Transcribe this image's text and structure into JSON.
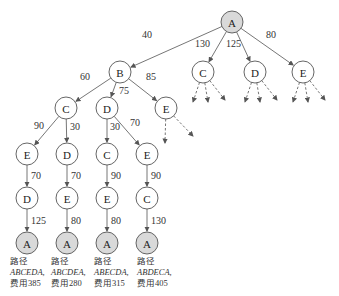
{
  "diagram": {
    "type": "search-tree",
    "colors": {
      "terminal_fill": "#d9d9d9",
      "node_fill": "#ffffff",
      "stroke": "#555555"
    },
    "nodes": [
      {
        "id": "root",
        "label": "A",
        "x": 232,
        "y": 22,
        "shaded": true
      },
      {
        "id": "B1",
        "label": "B",
        "x": 120,
        "y": 72
      },
      {
        "id": "C1",
        "label": "C",
        "x": 203,
        "y": 72
      },
      {
        "id": "D1",
        "label": "D",
        "x": 255,
        "y": 72
      },
      {
        "id": "E1",
        "label": "E",
        "x": 303,
        "y": 72
      },
      {
        "id": "C2",
        "label": "C",
        "x": 66,
        "y": 108
      },
      {
        "id": "D2",
        "label": "D",
        "x": 107,
        "y": 108
      },
      {
        "id": "E2",
        "label": "E",
        "x": 166,
        "y": 108
      },
      {
        "id": "E3a",
        "label": "E",
        "x": 27,
        "y": 154
      },
      {
        "id": "D3a",
        "label": "D",
        "x": 67,
        "y": 154
      },
      {
        "id": "C3b",
        "label": "C",
        "x": 107,
        "y": 154
      },
      {
        "id": "E3b",
        "label": "E",
        "x": 147,
        "y": 154
      },
      {
        "id": "D4a",
        "label": "D",
        "x": 27,
        "y": 198
      },
      {
        "id": "E4a",
        "label": "E",
        "x": 67,
        "y": 198
      },
      {
        "id": "E4b",
        "label": "E",
        "x": 107,
        "y": 198
      },
      {
        "id": "C4b",
        "label": "C",
        "x": 147,
        "y": 198
      },
      {
        "id": "A5a",
        "label": "A",
        "x": 27,
        "y": 243,
        "shaded": true
      },
      {
        "id": "A5b",
        "label": "A",
        "x": 67,
        "y": 243,
        "shaded": true
      },
      {
        "id": "A5c",
        "label": "A",
        "x": 107,
        "y": 243,
        "shaded": true
      },
      {
        "id": "A5d",
        "label": "A",
        "x": 147,
        "y": 243,
        "shaded": true
      }
    ],
    "edges": [
      {
        "from": "root",
        "to": "B1",
        "weight": "40",
        "lx": 142,
        "ly": 38
      },
      {
        "from": "root",
        "to": "C1",
        "weight": "130",
        "lx": 195,
        "ly": 47
      },
      {
        "from": "root",
        "to": "D1",
        "weight": "125",
        "lx": 226,
        "ly": 47
      },
      {
        "from": "root",
        "to": "E1",
        "weight": "80",
        "lx": 266,
        "ly": 38
      },
      {
        "from": "B1",
        "to": "C2",
        "weight": "60",
        "lx": 80,
        "ly": 80
      },
      {
        "from": "B1",
        "to": "D2",
        "weight": "75",
        "lx": 119,
        "ly": 94
      },
      {
        "from": "B1",
        "to": "E2",
        "weight": "85",
        "lx": 146,
        "ly": 80
      },
      {
        "from": "C2",
        "to": "E3a",
        "weight": "90",
        "lx": 34,
        "ly": 129
      },
      {
        "from": "C2",
        "to": "D3a",
        "weight": "30",
        "lx": 70,
        "ly": 130
      },
      {
        "from": "D2",
        "to": "C3b",
        "weight": "30",
        "lx": 110,
        "ly": 130
      },
      {
        "from": "D2",
        "to": "E3b",
        "weight": "70",
        "lx": 130,
        "ly": 126
      },
      {
        "from": "E3a",
        "to": "D4a",
        "weight": "70",
        "lx": 31,
        "ly": 179
      },
      {
        "from": "D3a",
        "to": "E4a",
        "weight": "70",
        "lx": 71,
        "ly": 179
      },
      {
        "from": "C3b",
        "to": "E4b",
        "weight": "90",
        "lx": 111,
        "ly": 179
      },
      {
        "from": "E3b",
        "to": "C4b",
        "weight": "90",
        "lx": 151,
        "ly": 179
      },
      {
        "from": "D4a",
        "to": "A5a",
        "weight": "125",
        "lx": 31,
        "ly": 224
      },
      {
        "from": "E4a",
        "to": "A5b",
        "weight": "80",
        "lx": 71,
        "ly": 224
      },
      {
        "from": "E4b",
        "to": "A5c",
        "weight": "80",
        "lx": 111,
        "ly": 224
      },
      {
        "from": "C4b",
        "to": "A5d",
        "weight": "130",
        "lx": 151,
        "ly": 224
      }
    ],
    "results": [
      {
        "label": "路径",
        "path": "ABCEDA,",
        "cost": "费用385",
        "x": 10,
        "y": 256
      },
      {
        "label": "路径",
        "path": "ABCDEA,",
        "cost": "费用280",
        "x": 51,
        "y": 256
      },
      {
        "label": "路径",
        "path": "ABECDA,",
        "cost": "费用315",
        "x": 94,
        "y": 256
      },
      {
        "label": "路径",
        "path": "ABDECA,",
        "cost": "费用405",
        "x": 137,
        "y": 256
      }
    ]
  }
}
